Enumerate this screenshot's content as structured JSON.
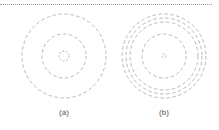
{
  "figure": {
    "stroke_color": "#b9b9b9",
    "panels": [
      {
        "id": "a",
        "label": "(a)",
        "center": [
          64,
          56
        ],
        "radii": [
          42,
          22,
          5
        ]
      },
      {
        "id": "b",
        "label": "(b)",
        "center": [
          164,
          56
        ],
        "radii": [
          42,
          38,
          34,
          22,
          2
        ]
      }
    ]
  }
}
